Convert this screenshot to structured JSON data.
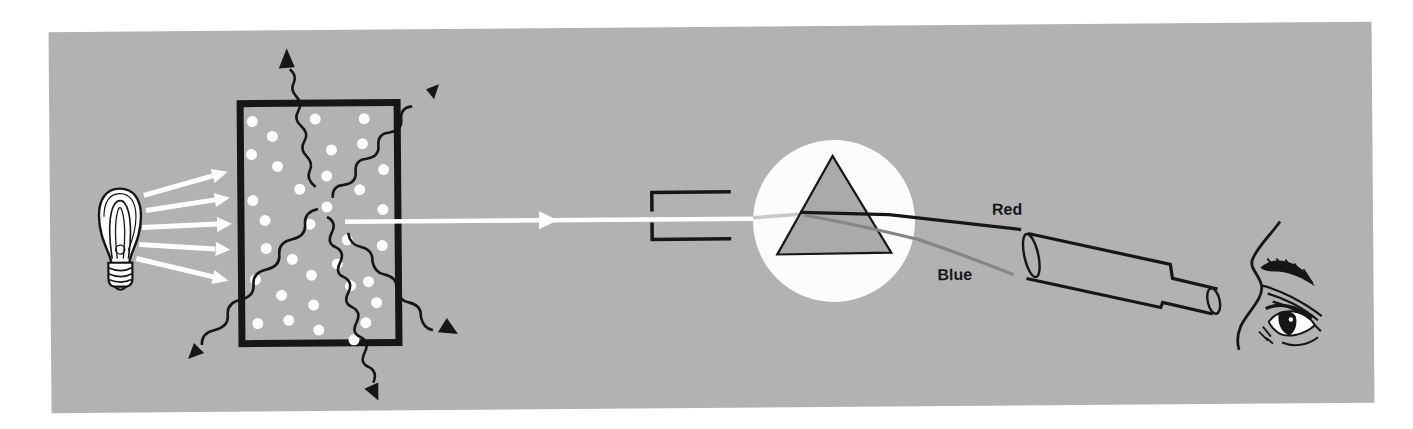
{
  "figure": {
    "labels": {
      "red_ray": "Red",
      "blue_ray": "Blue"
    },
    "colors": {
      "page_bg": "#ffffff",
      "panel_bg": "#b2b2b2",
      "ink": "#161616",
      "light": "#ffffff",
      "spotlight": "#fcfcfc",
      "prism_fill": "#aaaaaa",
      "red_ray": "#161616",
      "blue_ray": "#858585",
      "faint_beam": "#c8c8c8"
    },
    "components": [
      "light-bulb-icon",
      "light-ray-arrows",
      "gas-box",
      "gas-particles",
      "scattered-wave-arrows",
      "transmitted-beam",
      "slit-collimator",
      "spotlight-circle",
      "prism-icon",
      "red-ray-line",
      "blue-ray-line",
      "telescope-icon",
      "observer-eye-icon"
    ]
  }
}
